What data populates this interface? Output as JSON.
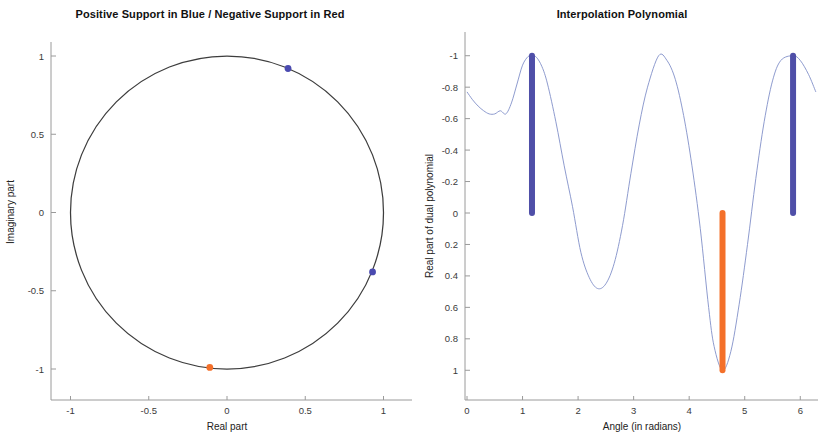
{
  "figure": {
    "background": "#ffffff",
    "colors": {
      "positive_support": "#4f4fa8",
      "negative_support": "#f4702a",
      "curve": "#8190c8",
      "unit_circle": "#3d3d3d",
      "axis": "#9a9a9a"
    }
  },
  "chart_data": [
    {
      "type": "scatter",
      "id": "unit-circle-support",
      "title": "Positive Support in Blue / Negative Support in Red",
      "xlabel": "Real part",
      "ylabel": "Imaginary part",
      "xlim": [
        -1.2,
        1.2
      ],
      "ylim": [
        -1.2,
        1.2
      ],
      "xticks": [
        -1,
        -0.5,
        0,
        0.5,
        1
      ],
      "xticklabels": [
        "-1",
        "-0.5",
        "0",
        "0.5",
        "1"
      ],
      "yticks": [
        -1,
        -0.5,
        0,
        0.5,
        1
      ],
      "yticklabels": [
        "-1",
        "-0.5",
        "0",
        "0.5",
        "1"
      ],
      "grid": false,
      "legend": "none",
      "annotations": [
        "Unit circle drawn in black",
        "Support atoms marked on the unit circle"
      ],
      "series": [
        {
          "name": "Unit circle",
          "kind": "line",
          "color": "#3d3d3d",
          "description": "circle of radius 1 centered at origin"
        },
        {
          "name": "Positive support (blue)",
          "kind": "points",
          "color": "#4f4fa8",
          "points": [
            {
              "x": 0.39,
              "y": 0.92,
              "angle": 1.17
            },
            {
              "x": 0.93,
              "y": -0.38,
              "angle": 5.87
            }
          ]
        },
        {
          "name": "Negative support (red)",
          "kind": "points",
          "color": "#f4702a",
          "points": [
            {
              "x": -0.11,
              "y": -0.99,
              "angle": 4.6
            }
          ]
        }
      ]
    },
    {
      "type": "line",
      "id": "interpolation-polynomial",
      "title": "Interpolation Polynomial",
      "xlabel": "Angle (in radians)",
      "ylabel": "Real part of dual polynomial",
      "xlim": [
        0,
        6.283
      ],
      "ylim": [
        -1.1,
        1.1
      ],
      "xticks": [
        0,
        1,
        2,
        3,
        4,
        5,
        6
      ],
      "xticklabels": [
        "0",
        "1",
        "2",
        "3",
        "4",
        "5",
        "6"
      ],
      "yticks": [
        -1,
        -0.8,
        -0.6,
        -0.4,
        -0.2,
        0,
        0.2,
        0.4,
        0.6,
        0.8,
        1
      ],
      "yticklabels": [
        "-1",
        "-0.8",
        "-0.6",
        "-0.4",
        "-0.2",
        "0",
        "0.2",
        "0.4",
        "0.6",
        "0.8",
        "1"
      ],
      "grid": false,
      "legend": "none",
      "series": [
        {
          "name": "Real part of dual polynomial",
          "kind": "curve",
          "color": "#8190c8",
          "x": [
            0.0,
            0.1,
            0.2,
            0.3,
            0.4,
            0.5,
            0.6,
            0.7,
            0.8,
            0.9,
            1.0,
            1.1,
            1.17,
            1.25,
            1.35,
            1.45,
            1.6,
            1.75,
            1.9,
            2.05,
            2.2,
            2.35,
            2.5,
            2.65,
            2.8,
            2.95,
            3.1,
            3.25,
            3.45,
            3.6,
            3.75,
            3.9,
            4.05,
            4.2,
            4.35,
            4.45,
            4.6,
            4.75,
            4.9,
            5.05,
            5.2,
            5.35,
            5.5,
            5.65,
            5.87,
            6.0,
            6.15,
            6.28
          ],
          "y": [
            0.77,
            0.72,
            0.68,
            0.65,
            0.63,
            0.63,
            0.65,
            0.63,
            0.7,
            0.82,
            0.94,
            0.995,
            1.0,
            0.99,
            0.93,
            0.82,
            0.58,
            0.3,
            0.04,
            -0.25,
            -0.41,
            -0.48,
            -0.45,
            -0.32,
            -0.08,
            0.25,
            0.56,
            0.8,
            1.0,
            0.97,
            0.85,
            0.62,
            0.3,
            -0.1,
            -0.6,
            -0.85,
            -1.0,
            -0.88,
            -0.58,
            -0.2,
            0.22,
            0.58,
            0.84,
            0.97,
            1.0,
            0.97,
            0.88,
            0.77
          ]
        },
        {
          "name": "Positive support (blue vertical markers)",
          "kind": "stems",
          "color": "#4f4fa8",
          "stems": [
            {
              "x": 1.17,
              "y0": 0,
              "y1": 1.0
            },
            {
              "x": 5.87,
              "y0": 0,
              "y1": 1.0
            }
          ]
        },
        {
          "name": "Negative support (orange vertical marker)",
          "kind": "stems",
          "color": "#f4702a",
          "stems": [
            {
              "x": 4.6,
              "y0": 0,
              "y1": -1.0
            }
          ]
        }
      ]
    }
  ],
  "left_chart": {
    "title": "Positive Support in Blue / Negative Support in Red",
    "xlabel": "Real part",
    "ylabel": "Imaginary part",
    "xticklabels": [
      "-1",
      "-0.5",
      "0",
      "0.5",
      "1"
    ],
    "yticklabels": [
      "1",
      "0.5",
      "0",
      "-0.5",
      "-1"
    ]
  },
  "right_chart": {
    "title": "Interpolation Polynomial",
    "xlabel": "Angle (in radians)",
    "ylabel": "Real part of dual polynomial",
    "xticklabels": [
      "0",
      "1",
      "2",
      "3",
      "4",
      "5",
      "6"
    ],
    "yticklabels": [
      "1",
      "0.8",
      "0.6",
      "0.4",
      "0.2",
      "0",
      "-0.2",
      "-0.4",
      "-0.6",
      "-0.8",
      "-1"
    ]
  }
}
